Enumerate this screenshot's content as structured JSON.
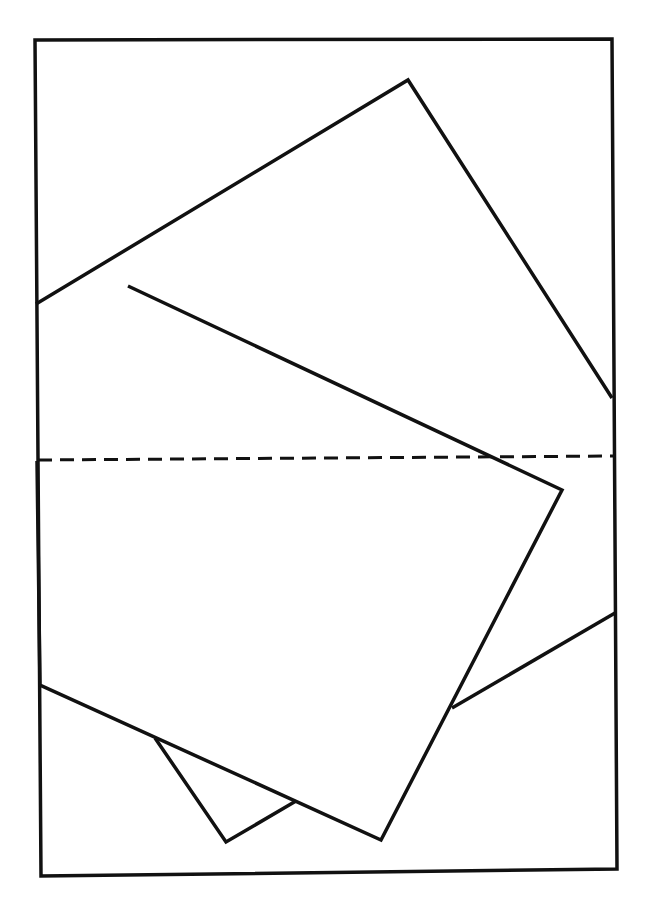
{
  "diagram": {
    "colors": {
      "stroke": "#111111",
      "background": "#ffffff"
    },
    "frame": {
      "points": [
        [
          35,
          40
        ],
        [
          612,
          39
        ],
        [
          617,
          869
        ],
        [
          41,
          876
        ]
      ]
    },
    "large_square": {
      "points": [
        [
          36,
          304
        ],
        [
          408,
          80
        ],
        [
          612,
          398
        ]
      ],
      "lower_visible": [
        [
          452,
          708
        ],
        [
          615,
          613
        ]
      ],
      "notch": [
        [
          155,
          738
        ],
        [
          226,
          842
        ],
        [
          296,
          801
        ]
      ]
    },
    "small_square": {
      "points": [
        [
          128,
          286
        ],
        [
          562,
          490
        ],
        [
          381,
          840
        ],
        [
          40,
          685
        ],
        [
          37,
          461
        ]
      ]
    },
    "dashed_line": {
      "from": [
        38,
        460
      ],
      "to": [
        613,
        456
      ]
    }
  }
}
